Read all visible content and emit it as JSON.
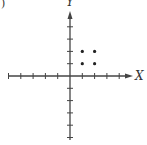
{
  "chart_data": {
    "type": "scatter",
    "title": "",
    "panel_label": ")",
    "xlabel": "X",
    "ylabel": "Y",
    "xlim": [
      -5,
      5
    ],
    "ylim": [
      -6,
      5
    ],
    "x_ticks": [
      -5,
      -4,
      -3,
      -2,
      -1,
      1,
      2,
      3,
      4
    ],
    "y_ticks": [
      -5,
      -4,
      -3,
      -2,
      -1,
      1,
      2,
      3,
      4
    ],
    "tick_labels_shown": false,
    "grid": false,
    "legend": null,
    "series": [
      {
        "name": "points",
        "points": [
          {
            "x": 1,
            "y": 2
          },
          {
            "x": 2,
            "y": 2
          },
          {
            "x": 1,
            "y": 1
          },
          {
            "x": 2,
            "y": 1
          }
        ]
      }
    ]
  },
  "style": {
    "axis_color": "#444444",
    "point_color": "#222222",
    "background": "#ffffff"
  },
  "layout": {
    "origin_px": [
      70,
      76
    ],
    "unit_px": 12.3
  }
}
